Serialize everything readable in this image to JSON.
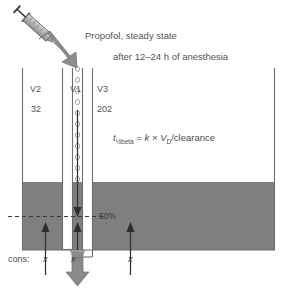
{
  "figure": {
    "type": "pharmacokinetic-compartment-diagram",
    "title": "Propofol, steady state",
    "subtitle": "after  12–24 h of anesthesia",
    "equation": {
      "lhs_symbol": "t",
      "lhs_subscript": "½beta",
      "text": "t½beta = k × VD/clearance",
      "rhs_k": "k",
      "times": "×",
      "rhs_vd_symbol": "V",
      "rhs_vd_subscript": "D",
      "rhs_tail": "/clearance",
      "equals": "="
    },
    "threshold_label": "50%",
    "concentration_row_label": "cons:",
    "concentration_values": [
      "x",
      "x",
      "x"
    ],
    "compartments": [
      {
        "name": "V2",
        "volume": "32"
      },
      {
        "name": "V1",
        "volume": "16"
      },
      {
        "name": "V3",
        "volume": "202"
      }
    ],
    "icons": {
      "syringe": "syringe-icon",
      "injection_arrow": "down-right-arrow-icon",
      "elimination_arrow": "down-arrow-icon",
      "drop": "drug-droplet-icon",
      "flow_up": "up-arrow-icon",
      "flow_down": "down-arrow-icon"
    },
    "colors": {
      "fill_gray": "#7f7f7f",
      "arrow_gray": "#7a7a7a",
      "line_dark": "#3a3a3a",
      "text_gray": "#555555",
      "background": "#ffffff",
      "column_white": "#ffffff"
    },
    "droplet_count": 11
  }
}
